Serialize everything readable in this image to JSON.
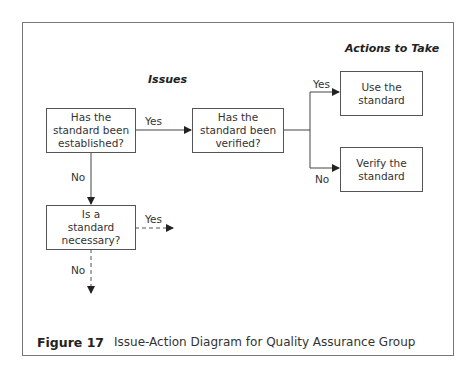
{
  "headers": {
    "issues": "Issues",
    "actions": "Actions to Take"
  },
  "nodes": {
    "established": "Has the standard been established?",
    "verified": "Has the standard been verified?",
    "use": "Use the standard",
    "verify": "Verify the standard",
    "necessary": "Is a standard necessary?"
  },
  "edges": {
    "established_yes": "Yes",
    "established_no": "No",
    "verified_yes": "Yes",
    "verified_no": "No",
    "necessary_yes": "Yes",
    "necessary_no": "No"
  },
  "caption": {
    "figure": "Figure 17",
    "text": "Issue-Action Diagram for Quality Assurance Group"
  }
}
